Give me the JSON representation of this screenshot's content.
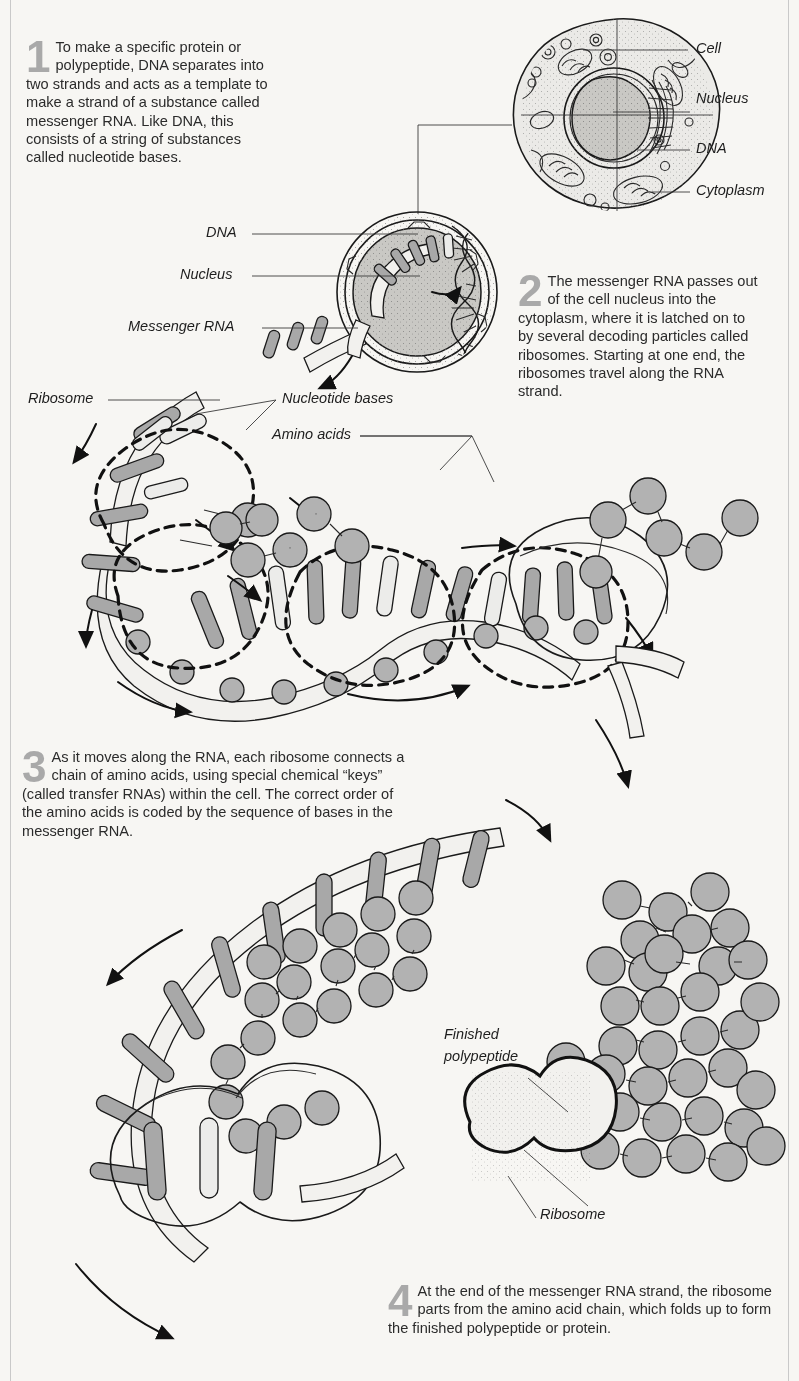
{
  "figure": {
    "background_color": "#f7f6f3",
    "ink_color": "#1a1a1a",
    "accent_gray": "#a9a9a9",
    "fill_gray": "#b2b2b2"
  },
  "steps": [
    {
      "number": "1",
      "text": "To make a specific protein or polypeptide, DNA separates into two strands and acts as a template to make a strand of a substance called messenger RNA. Like DNA, this consists of a string of substances called nucleotide bases."
    },
    {
      "number": "2",
      "text": "The messenger RNA passes out of the cell nucleus into the cytoplasm, where it is latched on to by several decoding particles called ribosomes. Starting at one end, the ribosomes travel along the RNA strand."
    },
    {
      "number": "3",
      "text": "As it moves along the RNA, each ribosome connects a chain of amino acids, using special chemical “keys” (called transfer RNAs) within the cell. The correct order of the amino acids is coded by the sequence of bases in the messenger RNA."
    },
    {
      "number": "4",
      "text": "At the end of the messenger RNA strand, the ribosome parts from the amino acid chain, which folds up to form the finished polypeptide or protein."
    }
  ],
  "labels": {
    "cell": "Cell",
    "nucleus_cell": "Nucleus",
    "dna_cell": "DNA",
    "cytoplasm": "Cytoplasm",
    "dna_closeup": "DNA",
    "nucleus_closeup": "Nucleus",
    "messenger_rna": "Messenger RNA",
    "ribosome_top": "Ribosome",
    "nucleotide_bases": "Nucleotide bases",
    "amino_acids": "Amino acids",
    "finished_polypeptide_line1": "Finished",
    "finished_polypeptide_line2": "polypeptide",
    "ribosome_bottom": "Ribosome"
  },
  "diagram_elements": {
    "cell_organelles": "mitochondria, vesicles, nucleus with nucleolus, endoplasmic reticulum",
    "nucleus_closeup_contents": "DNA double helix unwinding, messenger RNA strand exiting through nuclear pore",
    "rna_strand": "wavy messenger RNA ribbon with nucleotide base rungs",
    "ribosomes_on_strand": 3,
    "amino_acid_chain": "chain of spherical amino acids being assembled",
    "finished_polypeptide": "folded cluster of linked amino acid spheres",
    "free_ribosome": "detached peanut-shaped ribosome"
  }
}
